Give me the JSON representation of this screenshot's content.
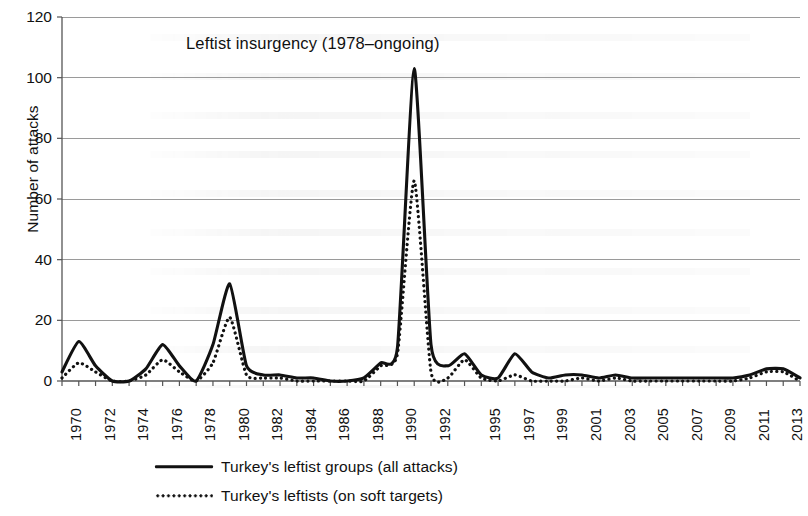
{
  "chart_data": {
    "type": "line",
    "title": "Leftist insurgency (1978–ongoing)",
    "xlabel": "",
    "ylabel": "Number of attacks",
    "ylim": [
      0,
      120
    ],
    "yticks": [
      0,
      20,
      40,
      60,
      80,
      100,
      120
    ],
    "xlim": [
      1970,
      2014
    ],
    "grid": "horizontal",
    "legend_position": "bottom",
    "x": [
      1970,
      1971,
      1972,
      1973,
      1974,
      1975,
      1976,
      1977,
      1978,
      1979,
      1980,
      1981,
      1982,
      1983,
      1984,
      1985,
      1986,
      1987,
      1988,
      1989,
      1990,
      1991,
      1992,
      1993,
      1994,
      1995,
      1996,
      1997,
      1998,
      1999,
      2000,
      2001,
      2002,
      2003,
      2004,
      2005,
      2006,
      2007,
      2008,
      2009,
      2010,
      2011,
      2012,
      2013,
      2014
    ],
    "xtick_labels": [
      "1970",
      "1972",
      "1974",
      "1976",
      "1978",
      "1980",
      "1982",
      "1984",
      "1986",
      "1988",
      "1990",
      "1992",
      "1995",
      "1997",
      "1999",
      "2001",
      "2003",
      "2005",
      "2007",
      "2009",
      "2011",
      "2013"
    ],
    "xtick_values": [
      1970,
      1972,
      1974,
      1976,
      1978,
      1980,
      1982,
      1984,
      1986,
      1988,
      1990,
      1992,
      1995,
      1997,
      1999,
      2001,
      2003,
      2005,
      2007,
      2009,
      2011,
      2013
    ],
    "series": [
      {
        "name": "Turkey's leftist groups (all attacks)",
        "style": "solid",
        "color": "#111111",
        "values": [
          3,
          13,
          5,
          0,
          0,
          4,
          12,
          5,
          0,
          12,
          32,
          5,
          2,
          2,
          1,
          1,
          0,
          0,
          1,
          6,
          11,
          103,
          12,
          5,
          9,
          2,
          1,
          9,
          3,
          1,
          2,
          2,
          1,
          2,
          1,
          1,
          1,
          1,
          1,
          1,
          1,
          2,
          4,
          4,
          1
        ]
      },
      {
        "name": "Turkey's leftists  (on soft targets)",
        "style": "dotted",
        "color": "#111111",
        "values": [
          1,
          6,
          3,
          0,
          0,
          2,
          7,
          3,
          0,
          6,
          21,
          2,
          1,
          1,
          0,
          0,
          0,
          0,
          0,
          5,
          9,
          66,
          3,
          1,
          7,
          1,
          0,
          2,
          0,
          0,
          0,
          1,
          0,
          1,
          0,
          0,
          0,
          0,
          0,
          0,
          0,
          1,
          3,
          3,
          0
        ]
      }
    ]
  },
  "axis": {
    "y_label": "Number of attacks",
    "y_ticks": [
      "0",
      "20",
      "40",
      "60",
      "80",
      "100",
      "120"
    ],
    "x_ticks": [
      "1970",
      "1972",
      "1974",
      "1976",
      "1978",
      "1980",
      "1982",
      "1984",
      "1986",
      "1988",
      "1990",
      "1992",
      "1995",
      "1997",
      "1999",
      "2001",
      "2003",
      "2005",
      "2007",
      "2009",
      "2011",
      "2013"
    ]
  },
  "annotation": {
    "title": "Leftist insurgency (1978–ongoing)"
  },
  "legend": {
    "items": [
      {
        "label": "Turkey's leftist groups (all attacks)",
        "marker": "solid-line-swatch"
      },
      {
        "label": "Turkey's leftists  (on soft targets)",
        "marker": "dotted-line-swatch"
      }
    ]
  },
  "colors": {
    "line": "#111111",
    "grid": "#9a9a9a",
    "background": "#ffffff"
  }
}
